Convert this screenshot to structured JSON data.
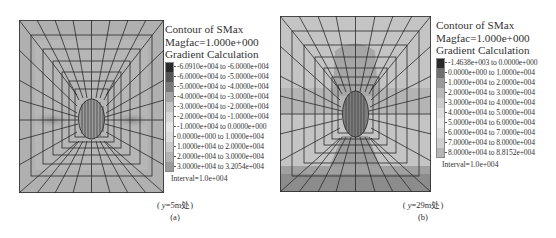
{
  "figures": [
    {
      "id": "a",
      "legend": {
        "title_lines": [
          "Contour of SMax",
          "Magfac=1.000e+000",
          "Gradient Calculation"
        ],
        "rows": [
          {
            "label": "-6.0910e+004 to -6.0000e+004",
            "color": "#2a2a2a"
          },
          {
            "label": "-6.0000e+004 to -5.0000e+004",
            "color": "#555555"
          },
          {
            "label": "-5.0000e+004 to -4.0000e+004",
            "color": "#7a7a7a"
          },
          {
            "label": "-4.0000e+004 to -3.0000e+004",
            "color": "#a5a5a5"
          },
          {
            "label": "-3.0000e+004 to -2.0000e+004",
            "color": "#c4c4c4"
          },
          {
            "label": "-2.0000e+004 to -1.0000e+004",
            "color": "#d6d6d6"
          },
          {
            "label": "-1.0000e+004 to 0.0000e+000",
            "color": "#e6e6e6"
          },
          {
            "label": "0.0000e+000 to 1.0000e+004",
            "color": "#dcdcdc"
          },
          {
            "label": "1.0000e+004 to 2.0000e+004",
            "color": "#c9c9c9"
          },
          {
            "label": "2.0000e+004 to 3.0000e+004",
            "color": "#b2b2b2"
          },
          {
            "label": "3.0000e+004 to 3.2054e+004",
            "color": "#9a9a9a"
          }
        ],
        "interval": "Interval=1.0e+004"
      },
      "caption": {
        "open": "(",
        "var": "y",
        "rest": "=5m处)",
        "letter": "(a)"
      }
    },
    {
      "id": "b",
      "legend": {
        "title_lines": [
          "Contour of SMax",
          "Magfac=1.000e+000",
          "Gradient Calculation"
        ],
        "rows": [
          {
            "label": "-1.4638e+003 to 0.0000e+000",
            "color": "#2a2a2a"
          },
          {
            "label": "0.0000e+000 to 1.0000e+004",
            "color": "#6e6e6e"
          },
          {
            "label": "1.0000e+004 to 2.0000e+004",
            "color": "#9a9a9a"
          },
          {
            "label": "2.0000e+004 to 3.0000e+004",
            "color": "#b9b9b9"
          },
          {
            "label": "3.0000e+004 to 4.0000e+004",
            "color": "#cccccc"
          },
          {
            "label": "4.0000e+004 to 5.0000e+004",
            "color": "#dddddd"
          },
          {
            "label": "5.0000e+004 to 6.0000e+004",
            "color": "#eaeaea"
          },
          {
            "label": "6.0000e+004 to 7.0000e+004",
            "color": "#dedede"
          },
          {
            "label": "7.0000e+004 to 8.0000e+004",
            "color": "#cfcfcf"
          },
          {
            "label": "8.0000e+004 to 8.8152e+004",
            "color": "#b5b5b5"
          }
        ],
        "interval": "Interval=1.0e+004"
      },
      "caption": {
        "open": "(",
        "var": "y",
        "rest": "=29m处)",
        "letter": "(b)"
      }
    }
  ]
}
